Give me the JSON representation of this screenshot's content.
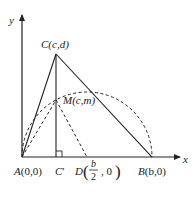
{
  "diagram": {
    "axes": {
      "x_label": "x",
      "y_label": "y"
    },
    "points": {
      "A": {
        "name": "A",
        "coords": "(0,0)"
      },
      "B": {
        "name": "B",
        "coords": "(b,0)"
      },
      "C": {
        "name": "C",
        "coords": "(c,d)"
      },
      "C_prime": {
        "name": "C",
        "prime": "′"
      },
      "D": {
        "name": "D",
        "frac_num": "b",
        "frac_den": "2",
        "tail": ", 0"
      },
      "M": {
        "name": "M",
        "coords": "(c,m)"
      }
    },
    "elements": [
      "triangle ABC (solid)",
      "altitude CC' perpendicular to AB with right-angle mark",
      "dashed semicircle centered at D with diameter AB",
      "dashed segment AM",
      "dashed segment MD"
    ],
    "colors": {
      "stroke": "#222222",
      "background": "#ffffff"
    }
  }
}
